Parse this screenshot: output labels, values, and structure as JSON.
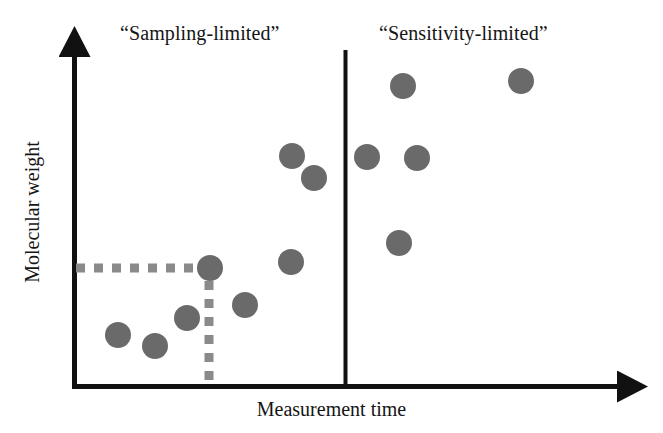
{
  "figure": {
    "x_axis_title": "Measurement time",
    "y_axis_title": "Molecular weight",
    "region_left_label": "“Sampling-limited”",
    "region_right_label": "“Sensitivity-limited”",
    "axis_color": "#111111",
    "point_color": "#6a6a6a",
    "guide_color": "#8a8a8a",
    "divider_color": "#111111",
    "background": "#ffffff"
  },
  "chart_data": {
    "type": "scatter",
    "title": "",
    "xlabel": "Measurement time",
    "ylabel": "Molecular weight",
    "xlim": [
      0,
      100
    ],
    "ylim": [
      0,
      100
    ],
    "grid": false,
    "legend": "none",
    "axis_ticks": [],
    "annotations": [
      {
        "name": "region-label-left",
        "text": "“Sampling-limited”",
        "x_px": 120,
        "y_px": 22
      },
      {
        "name": "region-label-right",
        "text": "“Sensitivity-limited”",
        "x_px": 379,
        "y_px": 22
      }
    ],
    "divider": {
      "name": "region-divider",
      "orientation": "vertical",
      "x_px": 345,
      "y_top_px": 50,
      "y_bottom_px": 386
    },
    "guide_lines": [
      {
        "name": "horizontal-threshold-guide",
        "orientation": "horizontal",
        "style": "dashed",
        "x_start_px": 74,
        "x_end_px": 205,
        "y_px": 268
      },
      {
        "name": "vertical-threshold-guide",
        "orientation": "vertical",
        "style": "dashed",
        "x_px": 209,
        "y_start_px": 280,
        "y_end_px": 385
      }
    ],
    "axes_geometry": {
      "origin_px": [
        72,
        386
      ],
      "y_axis_top_px": 42,
      "x_axis_right_px": 632
    },
    "points": [
      {
        "id": 1,
        "region": "sampling-limited",
        "x_px": 118,
        "y_px": 335,
        "r_px": 13
      },
      {
        "id": 2,
        "region": "sampling-limited",
        "x_px": 155,
        "y_px": 346,
        "r_px": 13
      },
      {
        "id": 3,
        "region": "sampling-limited",
        "x_px": 187,
        "y_px": 318,
        "r_px": 13
      },
      {
        "id": 4,
        "region": "sampling-limited",
        "x_px": 210,
        "y_px": 268,
        "r_px": 13
      },
      {
        "id": 5,
        "region": "sampling-limited",
        "x_px": 245,
        "y_px": 305,
        "r_px": 13
      },
      {
        "id": 6,
        "region": "sampling-limited",
        "x_px": 291,
        "y_px": 262,
        "r_px": 13
      },
      {
        "id": 7,
        "region": "sampling-limited",
        "x_px": 292,
        "y_px": 156,
        "r_px": 13
      },
      {
        "id": 8,
        "region": "sampling-limited",
        "x_px": 314,
        "y_px": 178,
        "r_px": 13
      },
      {
        "id": 9,
        "region": "sensitivity-limited",
        "x_px": 367,
        "y_px": 157,
        "r_px": 13
      },
      {
        "id": 10,
        "region": "sensitivity-limited",
        "x_px": 403,
        "y_px": 86,
        "r_px": 13
      },
      {
        "id": 11,
        "region": "sensitivity-limited",
        "x_px": 417,
        "y_px": 158,
        "r_px": 13
      },
      {
        "id": 12,
        "region": "sensitivity-limited",
        "x_px": 399,
        "y_px": 243,
        "r_px": 13
      },
      {
        "id": 13,
        "region": "sensitivity-limited",
        "x_px": 521,
        "y_px": 81,
        "r_px": 13
      }
    ]
  }
}
